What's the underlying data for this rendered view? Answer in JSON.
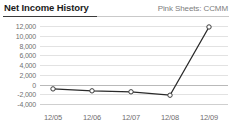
{
  "header": {
    "title": "Net Income History",
    "ticker_label": "Pink Sheets: CCMM"
  },
  "chart_data": {
    "type": "line",
    "title": "Net Income History",
    "subtitle": "Pink Sheets: CCMM",
    "xlabel": "",
    "ylabel": "",
    "categories": [
      "12/05",
      "12/06",
      "12/07",
      "12/08",
      "12/09"
    ],
    "values": [
      -900,
      -1300,
      -1500,
      -2200,
      11800
    ],
    "series": [
      {
        "name": "Net Income",
        "values": [
          -900,
          -1300,
          -1500,
          -2200,
          11800
        ]
      }
    ],
    "ylim": [
      -4000,
      12000
    ],
    "ytick_step": 2000,
    "ytick_labels": [
      "12,000",
      "10,000",
      "8,000",
      "6,000",
      "4,000",
      "2,000",
      "0",
      "-2,000",
      "-4,000"
    ],
    "ytick_values": [
      12000,
      10000,
      8000,
      6000,
      4000,
      2000,
      0,
      -2000,
      -4000
    ],
    "xtick_labels": [
      "12/05",
      "12/06",
      "12/07",
      "12/08",
      "12/09"
    ],
    "grid": true,
    "legend": "none",
    "marker": "open-circle",
    "line_color": "#2a2a2a",
    "marker_fill": "#ffffff",
    "marker_stroke": "#3a3a3a",
    "grid_color": "#e2e2e2",
    "zero_line_color": "#b9b9b9",
    "label_color": "#6f6f6f",
    "title_color": "#1b1b1b",
    "background": "#ffffff"
  }
}
